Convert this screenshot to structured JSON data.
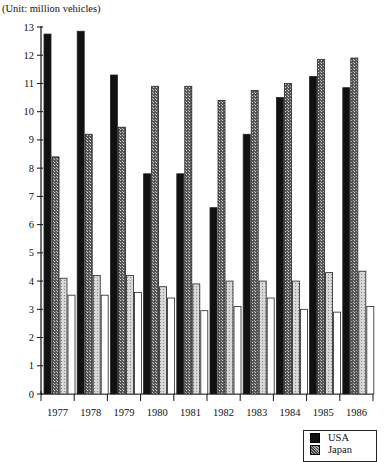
{
  "unit_label": "(Unit: million vehicles)",
  "chart_data": {
    "type": "bar",
    "title": "",
    "xlabel": "",
    "ylabel": "(Unit: million vehicles)",
    "ylim": [
      0,
      13
    ],
    "yticks": [
      0,
      1,
      2,
      3,
      4,
      5,
      6,
      7,
      8,
      9,
      10,
      11,
      12,
      13
    ],
    "grid": false,
    "legend_position": "bottom-right",
    "categories": [
      "1977",
      "1978",
      "1979",
      "1980",
      "1981",
      "1982",
      "1983",
      "1984",
      "1985",
      "1986"
    ],
    "series": [
      {
        "name": "USA",
        "pattern": "solid-black",
        "values": [
          12.75,
          12.85,
          11.3,
          7.8,
          7.8,
          6.6,
          9.2,
          10.5,
          11.25,
          10.85
        ]
      },
      {
        "name": "Japan",
        "pattern": "dark-hatched",
        "values": [
          8.4,
          9.2,
          9.45,
          10.9,
          10.9,
          10.4,
          10.75,
          11.0,
          11.85,
          11.9
        ]
      },
      {
        "name": "Series 3 (legend cut off)",
        "pattern": "light-dotted",
        "values": [
          4.1,
          4.2,
          4.2,
          3.8,
          3.9,
          4.0,
          4.0,
          4.0,
          4.3,
          4.35
        ]
      },
      {
        "name": "Series 4 (legend cut off)",
        "pattern": "white",
        "values": [
          3.5,
          3.5,
          3.6,
          3.4,
          2.95,
          3.1,
          3.4,
          3.0,
          2.9,
          3.1
        ]
      }
    ]
  },
  "legend": {
    "items": [
      {
        "label": "USA",
        "color": "#111111"
      },
      {
        "label": "Japan",
        "color": "#777777"
      }
    ]
  }
}
